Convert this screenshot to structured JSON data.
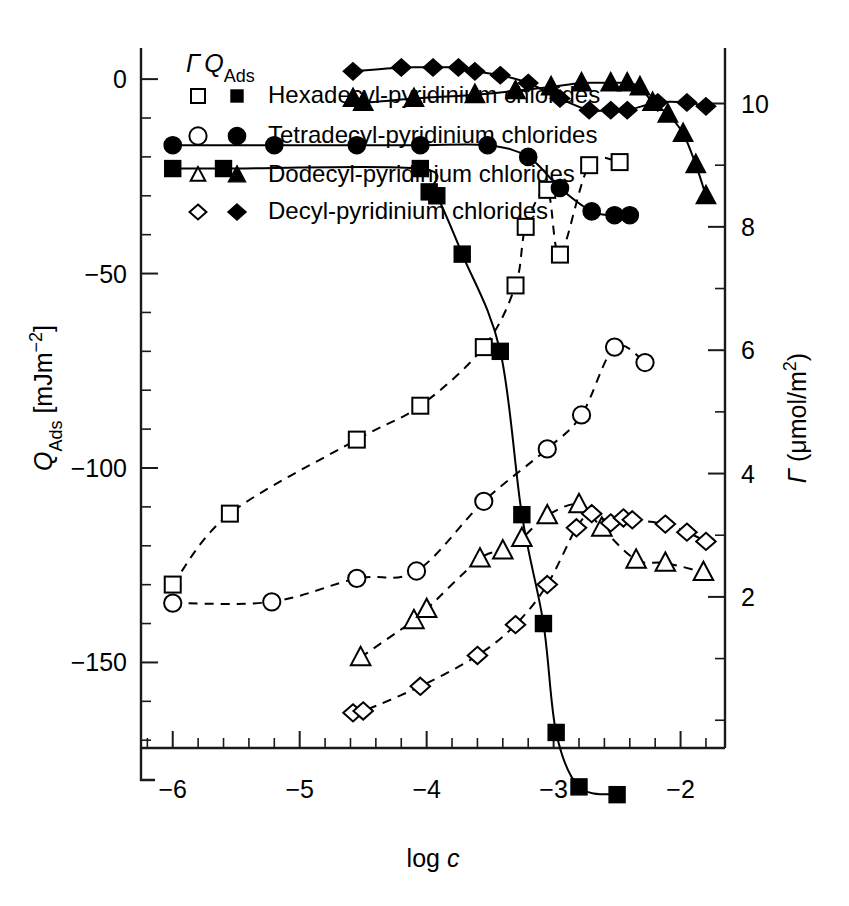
{
  "chart_data": {
    "type": "scatter",
    "title": "",
    "xlabel": "log c",
    "xlabel_parts": {
      "main": "log ",
      "italic": "c"
    },
    "ylabel_left": "Q_Ads [mJm^-2]",
    "ylabel_left_parts": {
      "q": "Q",
      "sub": "Ads",
      "unit": " [mJm",
      "sup": "−2",
      "close": "]"
    },
    "ylabel_right": "Γ (μmol/m²)",
    "ylabel_right_parts": {
      "gamma": "Γ",
      "unit": " (μmol/m",
      "sup": "2",
      "close": ")"
    },
    "xlim": [
      -6.25,
      -1.65
    ],
    "xticks": [
      -6,
      -5,
      -4,
      -3,
      -2
    ],
    "xticklabels": [
      "−6",
      "−5",
      "−4",
      "−3",
      "−2"
    ],
    "xminor_step": 0.2,
    "ylim_left": [
      -172,
      8
    ],
    "ylim_left_ticks": [
      -150,
      -100,
      -50,
      0
    ],
    "ylim_left_ticklabels": [
      "−150",
      "−100",
      "−50",
      "0"
    ],
    "yleft_minor_step": 10,
    "ylim_right": [
      -0.45,
      10.9
    ],
    "ylim_right_ticks": [
      2,
      4,
      6,
      8,
      10
    ],
    "ylim_right_ticklabels": [
      "2",
      "4",
      "6",
      "8",
      "10"
    ],
    "yright_minor_step": 1,
    "grid": false,
    "legend_position": "top-left",
    "legend_header": {
      "gamma": "Γ",
      "q": "Q",
      "q_sub": "Ads"
    },
    "series": [
      {
        "name": "Hexadecyl-pyridinium chlorides",
        "label": "Hexadecyl-pyridinium chlorides",
        "marker_open": "square",
        "marker_filled": "square",
        "gamma_axis": "right",
        "gamma_line": "dashed",
        "q_line": "solid",
        "gamma_points": [
          {
            "x": -6.0,
            "y": 2.2
          },
          {
            "x": -5.55,
            "y": 3.35
          },
          {
            "x": -4.55,
            "y": 4.55
          },
          {
            "x": -4.05,
            "y": 5.1
          },
          {
            "x": -3.55,
            "y": 6.05
          },
          {
            "x": -3.3,
            "y": 7.05
          },
          {
            "x": -3.22,
            "y": 8.0
          },
          {
            "x": -3.05,
            "y": 8.6
          },
          {
            "x": -2.95,
            "y": 7.55
          },
          {
            "x": -2.72,
            "y": 9.0
          },
          {
            "x": -2.48,
            "y": 9.05
          }
        ],
        "q_points": [
          {
            "x": -6.0,
            "y": -23
          },
          {
            "x": -5.6,
            "y": -23
          },
          {
            "x": -4.05,
            "y": -23
          },
          {
            "x": -3.98,
            "y": -29
          },
          {
            "x": -3.92,
            "y": -30
          },
          {
            "x": -3.72,
            "y": -45
          },
          {
            "x": -3.42,
            "y": -70
          },
          {
            "x": -3.25,
            "y": -112
          },
          {
            "x": -3.08,
            "y": -140
          },
          {
            "x": -2.98,
            "y": -168
          },
          {
            "x": -2.8,
            "y": -182
          },
          {
            "x": -2.5,
            "y": -184
          }
        ]
      },
      {
        "name": "Tetradecyl-pyridinium chlorides",
        "label": "Tetradecyl-pyridinium chlorides",
        "marker_open": "circle",
        "marker_filled": "circle",
        "gamma_axis": "right",
        "gamma_line": "dashed",
        "q_line": "solid",
        "gamma_points": [
          {
            "x": -6.0,
            "y": 1.9
          },
          {
            "x": -5.22,
            "y": 1.92
          },
          {
            "x": -4.55,
            "y": 2.3
          },
          {
            "x": -4.08,
            "y": 2.42
          },
          {
            "x": -3.55,
            "y": 3.55
          },
          {
            "x": -3.05,
            "y": 4.4
          },
          {
            "x": -2.78,
            "y": 4.95
          },
          {
            "x": -2.52,
            "y": 6.05
          },
          {
            "x": -2.28,
            "y": 5.8
          }
        ],
        "q_points": [
          {
            "x": -6.0,
            "y": -17
          },
          {
            "x": -5.2,
            "y": -17
          },
          {
            "x": -4.55,
            "y": -17
          },
          {
            "x": -4.05,
            "y": -17
          },
          {
            "x": -3.52,
            "y": -17
          },
          {
            "x": -3.2,
            "y": -20
          },
          {
            "x": -2.95,
            "y": -28
          },
          {
            "x": -2.7,
            "y": -34
          },
          {
            "x": -2.52,
            "y": -35
          },
          {
            "x": -2.4,
            "y": -35
          }
        ]
      },
      {
        "name": "Dodecyl-pyridinium chlorides",
        "label": "Dodecyl-pyridinium chlorides",
        "marker_open": "triangle",
        "marker_filled": "triangle",
        "gamma_axis": "right",
        "gamma_line": "dashed",
        "q_line": "solid",
        "gamma_points": [
          {
            "x": -4.52,
            "y": 1.02
          },
          {
            "x": -4.1,
            "y": 1.62
          },
          {
            "x": -4.0,
            "y": 1.8
          },
          {
            "x": -3.58,
            "y": 2.62
          },
          {
            "x": -3.4,
            "y": 2.75
          },
          {
            "x": -3.25,
            "y": 2.95
          },
          {
            "x": -3.05,
            "y": 3.32
          },
          {
            "x": -2.8,
            "y": 3.5
          },
          {
            "x": -2.62,
            "y": 3.12
          },
          {
            "x": -2.35,
            "y": 2.6
          },
          {
            "x": -2.12,
            "y": 2.55
          },
          {
            "x": -1.82,
            "y": 2.4
          }
        ],
        "q_points": [
          {
            "x": -4.58,
            "y": -5
          },
          {
            "x": -4.5,
            "y": -6
          },
          {
            "x": -4.1,
            "y": -5
          },
          {
            "x": -3.62,
            "y": -4
          },
          {
            "x": -3.3,
            "y": -3
          },
          {
            "x": -3.02,
            "y": -2
          },
          {
            "x": -2.78,
            "y": -1
          },
          {
            "x": -2.55,
            "y": -1
          },
          {
            "x": -2.42,
            "y": -1
          },
          {
            "x": -2.32,
            "y": -2
          },
          {
            "x": -2.22,
            "y": -6
          },
          {
            "x": -2.1,
            "y": -9
          },
          {
            "x": -1.98,
            "y": -14
          },
          {
            "x": -1.88,
            "y": -22
          },
          {
            "x": -1.8,
            "y": -30
          }
        ]
      },
      {
        "name": "Decyl-pyridinium chlorides",
        "label": "Decyl-pyridinium chlorides",
        "marker_open": "diamond",
        "marker_filled": "diamond",
        "gamma_axis": "right",
        "gamma_line": "dashed",
        "q_line": "solid",
        "gamma_points": [
          {
            "x": -4.58,
            "y": 0.12
          },
          {
            "x": -4.5,
            "y": 0.15
          },
          {
            "x": -4.05,
            "y": 0.55
          },
          {
            "x": -3.6,
            "y": 1.05
          },
          {
            "x": -3.3,
            "y": 1.55
          },
          {
            "x": -3.05,
            "y": 2.2
          },
          {
            "x": -2.82,
            "y": 3.12
          },
          {
            "x": -2.7,
            "y": 3.35
          },
          {
            "x": -2.55,
            "y": 3.2
          },
          {
            "x": -2.45,
            "y": 3.28
          },
          {
            "x": -2.38,
            "y": 3.25
          },
          {
            "x": -2.12,
            "y": 3.18
          },
          {
            "x": -1.95,
            "y": 3.05
          },
          {
            "x": -1.8,
            "y": 2.9
          }
        ],
        "q_points": [
          {
            "x": -4.58,
            "y": 2
          },
          {
            "x": -4.2,
            "y": 3
          },
          {
            "x": -3.95,
            "y": 3
          },
          {
            "x": -3.75,
            "y": 3
          },
          {
            "x": -3.62,
            "y": 2
          },
          {
            "x": -3.42,
            "y": 1
          },
          {
            "x": -3.2,
            "y": -1
          },
          {
            "x": -2.95,
            "y": -5
          },
          {
            "x": -2.72,
            "y": -8
          },
          {
            "x": -2.55,
            "y": -8
          },
          {
            "x": -2.42,
            "y": -8
          },
          {
            "x": -2.18,
            "y": -6
          },
          {
            "x": -1.95,
            "y": -6
          },
          {
            "x": -1.8,
            "y": -7
          }
        ]
      }
    ]
  }
}
